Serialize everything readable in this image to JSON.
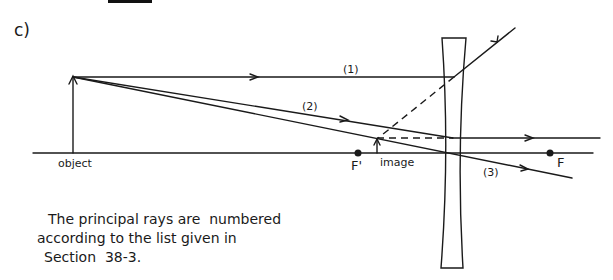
{
  "part_label": "c)",
  "top_bar": {
    "color": "#111111"
  },
  "labels": {
    "object": "object",
    "image": "image",
    "focal_near": "F'",
    "focal_far": "F",
    "ray1": "(1)",
    "ray2": "(2)",
    "ray3": "(3)"
  },
  "caption": {
    "line1": "The principal rays are  numbered",
    "line2": "according to the list given in",
    "line3": "Section  38-3."
  },
  "colors": {
    "ink": "#1a1a1a",
    "background": "#ffffff"
  },
  "diagram": {
    "type": "diverging-lens ray diagram",
    "optical_axis_y": 153,
    "lens_center_x": 453,
    "object": {
      "x": 73,
      "base_y": 153,
      "tip_y": 76
    },
    "image": {
      "x": 377,
      "base_y": 153,
      "tip_y": 139
    },
    "focal_points": {
      "F_prime_x": 358,
      "F_x": 550
    }
  }
}
